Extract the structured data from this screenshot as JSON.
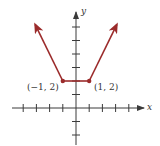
{
  "chart_data": {
    "type": "line",
    "title": "",
    "xlabel": "x",
    "ylabel": "y",
    "xlim": [
      -5,
      5
    ],
    "ylim": [
      -3,
      7
    ],
    "grid": false,
    "tick_step": 1,
    "series": [
      {
        "name": "piecewise graph",
        "color": "#9b2b2b",
        "points": [
          [
            -3.1,
            6.2
          ],
          [
            -1,
            2
          ],
          [
            1,
            2
          ],
          [
            3.1,
            6.2
          ]
        ],
        "arrow_start": true,
        "arrow_end": true
      }
    ],
    "annotations": [
      {
        "text": "(−1, 2)",
        "x": -1,
        "y": 2,
        "marker": true
      },
      {
        "text": "(1, 2)",
        "x": 1,
        "y": 2,
        "marker": true
      }
    ]
  },
  "labels": {
    "x_axis": "x",
    "y_axis": "y",
    "point_left": "(−1, 2)",
    "point_right": "(1, 2)"
  },
  "colors": {
    "curve": "#9b2b2b",
    "axis": "#3a3a3a"
  }
}
